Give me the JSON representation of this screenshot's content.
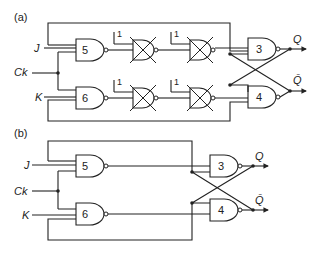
{
  "diagram": {
    "type": "logic-circuit",
    "panels": [
      {
        "label": "(a)",
        "inputs": [
          "J",
          "Ck",
          "K"
        ],
        "outputs": [
          "Q",
          "Q̄"
        ],
        "gates": [
          {
            "id": "5",
            "type": "NAND"
          },
          {
            "id": "6",
            "type": "NAND"
          },
          {
            "id": "x1",
            "type": "NAND",
            "crossed_out": true,
            "const_input": "1"
          },
          {
            "id": "x2",
            "type": "NAND",
            "crossed_out": true,
            "const_input": "1"
          },
          {
            "id": "x3",
            "type": "NAND",
            "crossed_out": true,
            "const_input": "1"
          },
          {
            "id": "x4",
            "type": "NAND",
            "crossed_out": true,
            "const_input": "1"
          },
          {
            "id": "3",
            "type": "NAND"
          },
          {
            "id": "4",
            "type": "NAND"
          }
        ]
      },
      {
        "label": "(b)",
        "inputs": [
          "J",
          "Ck",
          "K"
        ],
        "outputs": [
          "Q",
          "Q̄"
        ],
        "gates": [
          {
            "id": "5",
            "type": "NAND"
          },
          {
            "id": "6",
            "type": "NAND"
          },
          {
            "id": "3",
            "type": "NAND"
          },
          {
            "id": "4",
            "type": "NAND"
          }
        ]
      }
    ]
  },
  "labels": {
    "a": "(a)",
    "b": "(b)",
    "J": "J",
    "K": "K",
    "Ck": "Ck",
    "Q": "Q",
    "Qbar": "Q̄",
    "g5": "5",
    "g6": "6",
    "g3": "3",
    "g4": "4",
    "one": "1"
  }
}
